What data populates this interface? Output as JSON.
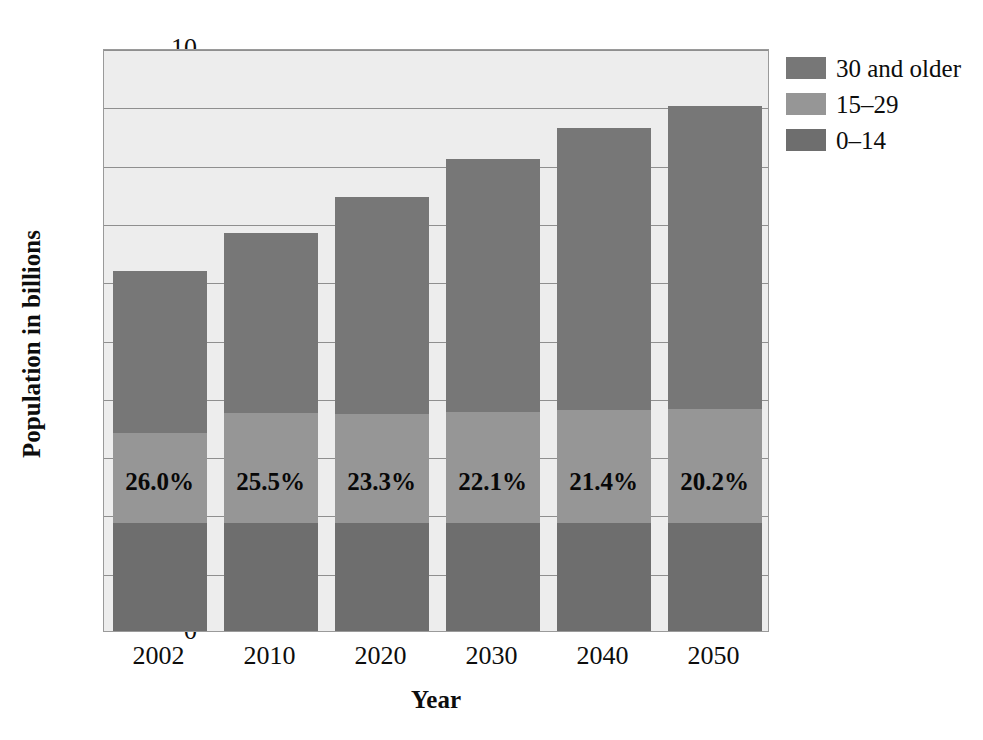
{
  "chart_data": {
    "type": "bar",
    "subtype": "stacked-bar",
    "title": "",
    "xlabel": "Year",
    "ylabel": "Population in billions",
    "categories": [
      "2002",
      "2010",
      "2020",
      "2030",
      "2040",
      "2050"
    ],
    "ylim": [
      0,
      10
    ],
    "yticks": [
      0,
      1,
      2,
      3,
      4,
      5,
      6,
      7,
      8,
      9,
      10
    ],
    "ytick_labels": [
      "0",
      "1",
      "2",
      "3",
      "4",
      "5",
      "6",
      "7",
      "8",
      "9",
      "10"
    ],
    "grid": true,
    "legend_position": "right-top",
    "series": [
      {
        "name": "0–14",
        "color": "#6e6e6e",
        "values": [
          1.85,
          1.85,
          1.86,
          1.86,
          1.86,
          1.85
        ]
      },
      {
        "name": "15–29",
        "color": "#969696",
        "values": [
          1.55,
          1.89,
          1.86,
          1.9,
          1.93,
          1.96
        ]
      },
      {
        "name": "30 and older",
        "color": "#777777",
        "values": [
          2.77,
          3.09,
          3.73,
          4.34,
          4.83,
          5.19
        ]
      }
    ],
    "totals": [
      6.17,
      6.83,
      7.45,
      8.1,
      8.62,
      9.0
    ],
    "segment_tops": {
      "young": [
        1.85,
        1.85,
        1.86,
        1.86,
        1.86,
        1.85
      ],
      "mid": [
        3.4,
        3.74,
        3.72,
        3.76,
        3.79,
        3.81
      ],
      "older": [
        6.17,
        6.83,
        7.45,
        8.1,
        8.62,
        9.0
      ]
    },
    "annotations": [
      "26.0%",
      "25.5%",
      "23.3%",
      "22.1%",
      "21.4%",
      "20.2%"
    ],
    "annotation_note": "share of population aged 15-29 plus 0-14 label placed in the 15-29 band"
  },
  "legend": {
    "items": [
      {
        "label": "30 and older",
        "color": "#777777"
      },
      {
        "label": "15–29",
        "color": "#969696"
      },
      {
        "label": "0–14",
        "color": "#6e6e6e"
      }
    ]
  },
  "axes": {
    "y_title": "Population in billions",
    "x_title": "Year",
    "y_ticks": [
      "10",
      "9",
      "8",
      "7",
      "6",
      "5",
      "4",
      "3",
      "2",
      "1",
      "0"
    ],
    "x_ticks": [
      "2002",
      "2010",
      "2020",
      "2030",
      "2040",
      "2050"
    ]
  },
  "colors": {
    "plot_background": "#ededed",
    "grid": "#8f8f8f",
    "frame": "#9a9a9a",
    "text": "#0d0d0d",
    "page_background": "#ffffff"
  }
}
